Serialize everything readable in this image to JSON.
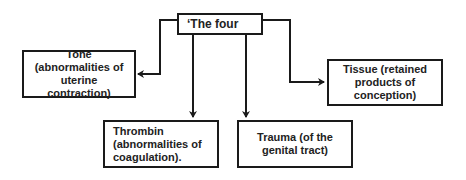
{
  "diagram": {
    "root": {
      "label": "‘The four"
    },
    "nodes": [
      {
        "id": "tone",
        "label": "Tone (abnormalities of uterine contraction)"
      },
      {
        "id": "tissue",
        "label": "Tissue (retained products of conception)"
      },
      {
        "id": "thrombin",
        "label": "Thrombin (abnormalities of coagulation)."
      },
      {
        "id": "trauma",
        "label": "Trauma (of the genital tract)"
      }
    ],
    "edges": [
      {
        "from": "root",
        "to": "tone"
      },
      {
        "from": "root",
        "to": "thrombin"
      },
      {
        "from": "root",
        "to": "trauma"
      },
      {
        "from": "root",
        "to": "tissue"
      }
    ],
    "colors": {
      "line": "#1a1a1a",
      "text": "#222222",
      "background": "#ffffff"
    }
  }
}
